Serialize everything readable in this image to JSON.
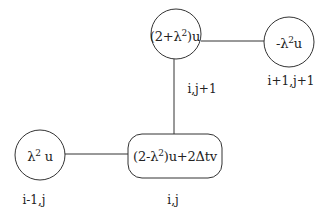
{
  "diagram": {
    "type": "finite-difference stencil",
    "stroke_color": "#333333",
    "background": "#ffffff",
    "nodes": [
      {
        "id": "top-center",
        "shape": "circle",
        "expr_prefix": "(2+λ",
        "expr_sup": "2",
        "expr_suffix": ")u",
        "index_label": "i,j+1"
      },
      {
        "id": "top-right",
        "shape": "circle",
        "expr_prefix": "-λ",
        "expr_sup": "2",
        "expr_suffix": "u",
        "index_label": "i+1,j+1"
      },
      {
        "id": "bottom-left",
        "shape": "circle",
        "expr_prefix": "λ",
        "expr_sup": "2",
        "expr_suffix": " u",
        "index_label": "i-1,j"
      },
      {
        "id": "bottom-center",
        "shape": "rounded-rectangle",
        "expr_prefix": "(2-λ",
        "expr_sup": "2",
        "expr_suffix": ")u+2Δtv",
        "index_label": "i,j"
      }
    ],
    "edges": [
      {
        "from": "top-center",
        "to": "top-right"
      },
      {
        "from": "top-center",
        "to": "bottom-center"
      },
      {
        "from": "bottom-left",
        "to": "bottom-center"
      }
    ]
  }
}
